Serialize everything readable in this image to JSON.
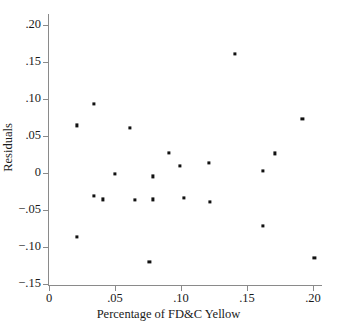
{
  "chart_data": {
    "type": "scatter",
    "title": "",
    "xlabel": "Percentage of FD&C Yellow",
    "ylabel": "Residuals",
    "xlim": [
      0.0,
      0.2075
    ],
    "ylim": [
      -0.15,
      0.2
    ],
    "grid": false,
    "legend": null,
    "xticks": [
      0.0,
      0.05,
      0.1,
      0.15,
      0.2
    ],
    "xticklabels": [
      "0",
      ".05",
      ".10",
      ".15",
      ".20"
    ],
    "yticks": [
      0.2,
      0.15,
      0.1,
      0.05,
      0.0,
      -0.05,
      -0.1,
      -0.15
    ],
    "yticklabels": [
      ".20",
      ".15",
      ".10",
      ".05",
      "0",
      "−.05",
      "−.10",
      "−.15"
    ],
    "marker": "square",
    "marker_color": "#111111",
    "points": [
      {
        "x": 0.021,
        "y": 0.064
      },
      {
        "x": 0.021,
        "y": -0.087
      },
      {
        "x": 0.034,
        "y": 0.093
      },
      {
        "x": 0.034,
        "y": -0.031
      },
      {
        "x": 0.041,
        "y": -0.036
      },
      {
        "x": 0.05,
        "y": -0.002
      },
      {
        "x": 0.061,
        "y": 0.061
      },
      {
        "x": 0.065,
        "y": -0.037
      },
      {
        "x": 0.076,
        "y": -0.12
      },
      {
        "x": 0.079,
        "y": -0.005
      },
      {
        "x": 0.079,
        "y": -0.036
      },
      {
        "x": 0.091,
        "y": 0.027
      },
      {
        "x": 0.099,
        "y": 0.009
      },
      {
        "x": 0.102,
        "y": -0.034
      },
      {
        "x": 0.121,
        "y": 0.013
      },
      {
        "x": 0.122,
        "y": -0.039
      },
      {
        "x": 0.141,
        "y": 0.16
      },
      {
        "x": 0.162,
        "y": 0.002
      },
      {
        "x": 0.162,
        "y": -0.072
      },
      {
        "x": 0.171,
        "y": 0.026
      },
      {
        "x": 0.192,
        "y": 0.073
      },
      {
        "x": 0.201,
        "y": -0.115
      }
    ]
  }
}
